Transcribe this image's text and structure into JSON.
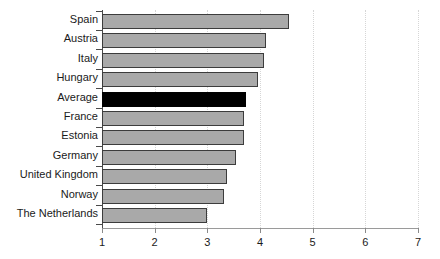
{
  "chart_data": {
    "type": "bar",
    "orientation": "horizontal",
    "title": "",
    "xlabel": "",
    "ylabel": "",
    "xlim": [
      1,
      7
    ],
    "xticks": [
      "1",
      "2",
      "3",
      "4",
      "5",
      "6",
      "7"
    ],
    "grid": "vertical-dotted",
    "legend": "none",
    "categories": [
      "Spain",
      "Austria",
      "Italy",
      "Hungary",
      "Average",
      "France",
      "Estonia",
      "Germany",
      "United Kingdom",
      "Norway",
      "The Netherlands"
    ],
    "values": [
      4.52,
      4.08,
      4.03,
      3.92,
      3.7,
      3.65,
      3.65,
      3.5,
      3.34,
      3.28,
      2.95
    ],
    "highlight_category": "Average",
    "colors": {
      "bar_fill": "#a9a9a9",
      "bar_border": "#3c3c3c",
      "highlight_fill": "#000000",
      "axis": "#4a4a4a",
      "grid": "#d6d6d6",
      "text": "#1a1a1a",
      "background": "#ffffff"
    }
  }
}
